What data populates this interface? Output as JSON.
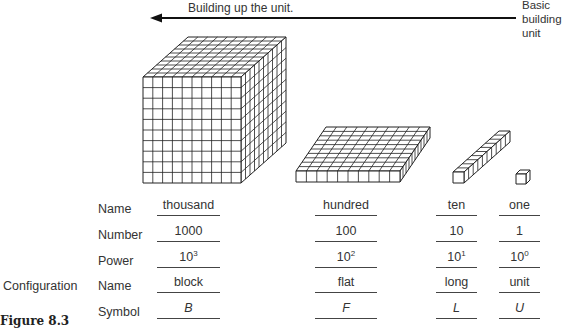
{
  "header": {
    "arrow_label": "Building up the unit.",
    "basic_unit_label": [
      "Basic",
      "building",
      "unit"
    ]
  },
  "pieces": [
    {
      "name": "block",
      "grid": [
        10,
        10,
        10
      ]
    },
    {
      "name": "flat",
      "grid": [
        10,
        1,
        10
      ]
    },
    {
      "name": "long",
      "grid": [
        1,
        1,
        10
      ]
    },
    {
      "name": "unit",
      "grid": [
        1,
        1,
        1
      ]
    }
  ],
  "table": {
    "group_label": "Configuration",
    "row_labels": [
      "Name",
      "Number",
      "Power",
      "Name",
      "Symbol"
    ],
    "columns": [
      {
        "name": "thousand",
        "number": "1000",
        "power_base": "10",
        "power_exp": "3",
        "config": "block",
        "symbol": "B"
      },
      {
        "name": "hundred",
        "number": "100",
        "power_base": "10",
        "power_exp": "2",
        "config": "flat",
        "symbol": "F"
      },
      {
        "name": "ten",
        "number": "10",
        "power_base": "10",
        "power_exp": "1",
        "config": "long",
        "symbol": "L"
      },
      {
        "name": "one",
        "number": "1",
        "power_base": "10",
        "power_exp": "0",
        "config": "unit",
        "symbol": "U"
      }
    ]
  },
  "caption": "Figure 8.3"
}
